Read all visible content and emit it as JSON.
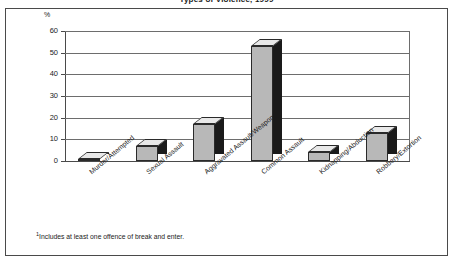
{
  "title": "Types of Violence, 1999",
  "footnote_marker": "1",
  "footnote": "Includes at least one offence of break and enter.",
  "chart_data": {
    "type": "bar",
    "title": "Types of Violence, 1999",
    "xlabel": "",
    "ylabel": "%",
    "ylim": [
      0,
      60
    ],
    "yticks": [
      0,
      10,
      20,
      30,
      40,
      50,
      60
    ],
    "grid": true,
    "legend": "none",
    "style": "3d-column",
    "categories": [
      "Murder/Attempted",
      "Sexual Assault",
      "Aggravated Assault/Weapon",
      "Common Assault",
      "Kidnapping/Abduction",
      "Robbery/Extortion"
    ],
    "values": [
      1,
      7,
      17,
      53,
      4,
      13
    ],
    "colors": {
      "bar_front": "#b8b8b8",
      "bar_side": "#1a1a1a",
      "bar_top": "#e8e8e8",
      "axis": "#4a4a4a",
      "grid": "#6d6d6d",
      "text": "#1b1b1b",
      "background": "#ffffff"
    }
  },
  "axis": {
    "unit_label": "%",
    "ticks": [
      {
        "label": "60",
        "value": 60
      },
      {
        "label": "50",
        "value": 50
      },
      {
        "label": "40",
        "value": 40
      },
      {
        "label": "30",
        "value": 30
      },
      {
        "label": "20",
        "value": 20
      },
      {
        "label": "10",
        "value": 10
      },
      {
        "label": "0",
        "value": 0
      }
    ]
  }
}
